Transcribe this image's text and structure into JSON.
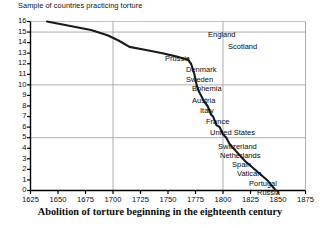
{
  "chart_data": {
    "type": "line",
    "title": "Sample of countries practicing torture",
    "caption": "Abolition of torture beginning in the eighteenth century",
    "xlabel": "",
    "ylabel": "",
    "xlim": [
      1625,
      1875
    ],
    "ylim": [
      0,
      16
    ],
    "xticks": [
      1625,
      1650,
      1675,
      1700,
      1725,
      1750,
      1775,
      1800,
      1825,
      1850,
      1875
    ],
    "yticks": [
      0,
      1,
      2,
      3,
      4,
      5,
      6,
      7,
      8,
      9,
      10,
      11,
      12,
      13,
      14,
      15,
      16
    ],
    "grid": {
      "x_at": [
        1700,
        1800
      ],
      "y_at": [
        5,
        10,
        15
      ]
    },
    "legend": "none",
    "series": [
      {
        "name": "Countries practicing torture",
        "x": [
          1640,
          1660,
          1680,
          1695,
          1705,
          1715,
          1730,
          1745,
          1757,
          1764,
          1768,
          1771,
          1774,
          1776,
          1778,
          1780,
          1783,
          1786,
          1789,
          1791,
          1794,
          1797,
          1800,
          1803,
          1806,
          1812,
          1820,
          1830,
          1840,
          1848
        ],
        "y": [
          16,
          15.6,
          15.2,
          14.7,
          14.2,
          13.6,
          13.3,
          13.0,
          12.7,
          12.5,
          12.4,
          12.0,
          11.0,
          10.0,
          9.4,
          9.0,
          8.4,
          8.0,
          7.2,
          7.0,
          6.2,
          6.0,
          5.3,
          5.0,
          4.4,
          3.7,
          2.8,
          1.9,
          1.0,
          0.0
        ]
      }
    ],
    "annotations": [
      {
        "label": "England",
        "x_px": 208,
        "y_px": 31
      },
      {
        "label": "Scotland",
        "x_px": 228,
        "y_px": 43
      },
      {
        "label": "Prussia",
        "x_px": 165,
        "y_px": 55
      },
      {
        "label": "Denmark",
        "x_px": 186,
        "y_px": 66
      },
      {
        "label": "Sweden",
        "x_px": 186,
        "y_px": 76
      },
      {
        "label": "Bohemia",
        "x_px": 192,
        "y_px": 85
      },
      {
        "label": "Austria",
        "x_px": 192,
        "y_px": 97
      },
      {
        "label": "Italy",
        "x_px": 200,
        "y_px": 107
      },
      {
        "label": "France",
        "x_px": 206,
        "y_px": 118
      },
      {
        "label": "United States",
        "x_px": 210,
        "y_px": 129
      },
      {
        "label": "Switzerland",
        "x_px": 218,
        "y_px": 143
      },
      {
        "label": "Netherlands",
        "x_px": 220,
        "y_px": 152
      },
      {
        "label": "Spain",
        "x_px": 232,
        "y_px": 161
      },
      {
        "label": "Vatican",
        "x_px": 237,
        "y_px": 170
      },
      {
        "label": "Portugal",
        "x_px": 249,
        "y_px": 180
      },
      {
        "label": "Russia",
        "x_px": 257,
        "y_px": 189
      }
    ],
    "colors": {
      "line": "#1a1a1a",
      "grid": "#9a9a9a",
      "axis": "#000000",
      "background": "#ffffff"
    }
  }
}
